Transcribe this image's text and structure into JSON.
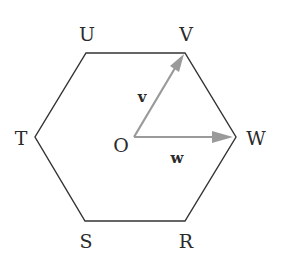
{
  "diagram": {
    "type": "regular-hexagon-vectors",
    "colors": {
      "hexagon_stroke": "#333333",
      "vector_stroke": "#9a9a9a",
      "label": "#2a2a2a",
      "background": "#ffffff"
    },
    "vertices": [
      {
        "id": "U",
        "label": "U"
      },
      {
        "id": "V",
        "label": "V"
      },
      {
        "id": "W",
        "label": "W"
      },
      {
        "id": "R",
        "label": "R"
      },
      {
        "id": "S",
        "label": "S"
      },
      {
        "id": "T",
        "label": "T"
      }
    ],
    "center": {
      "id": "O",
      "label": "O"
    },
    "vectors": [
      {
        "id": "v",
        "label": "v",
        "from": "O",
        "to": "V"
      },
      {
        "id": "w",
        "label": "w",
        "from": "O",
        "to": "W"
      }
    ]
  }
}
